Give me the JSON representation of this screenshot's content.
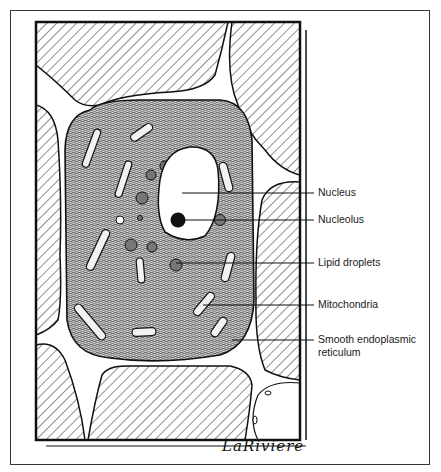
{
  "figure": {
    "labels": [
      {
        "id": "nucleus",
        "text": "Nucleus",
        "line2": ""
      },
      {
        "id": "nucleolus",
        "text": "Nucleolus",
        "line2": ""
      },
      {
        "id": "lipid-droplets",
        "text": "Lipid droplets",
        "line2": ""
      },
      {
        "id": "mitochondria",
        "text": "Mitochondria",
        "line2": ""
      },
      {
        "id": "ser",
        "text": "Smooth endoplasmic",
        "line2": "reticulum"
      }
    ],
    "signature": "LaRiviere"
  },
  "colors": {
    "ink": "#111111",
    "paper": "#ffffff",
    "cytoplasm": "#8a8a8a"
  }
}
